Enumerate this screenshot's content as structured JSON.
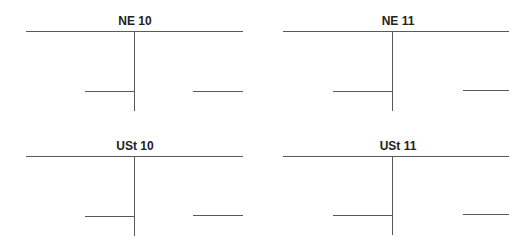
{
  "accounts": [
    {
      "title": "NE 10"
    },
    {
      "title": "NE 11"
    },
    {
      "title": "USt 10"
    },
    {
      "title": "USt 11"
    }
  ],
  "colors": {
    "line": "#5a5a5a",
    "text": "#222222",
    "background": "#ffffff"
  }
}
